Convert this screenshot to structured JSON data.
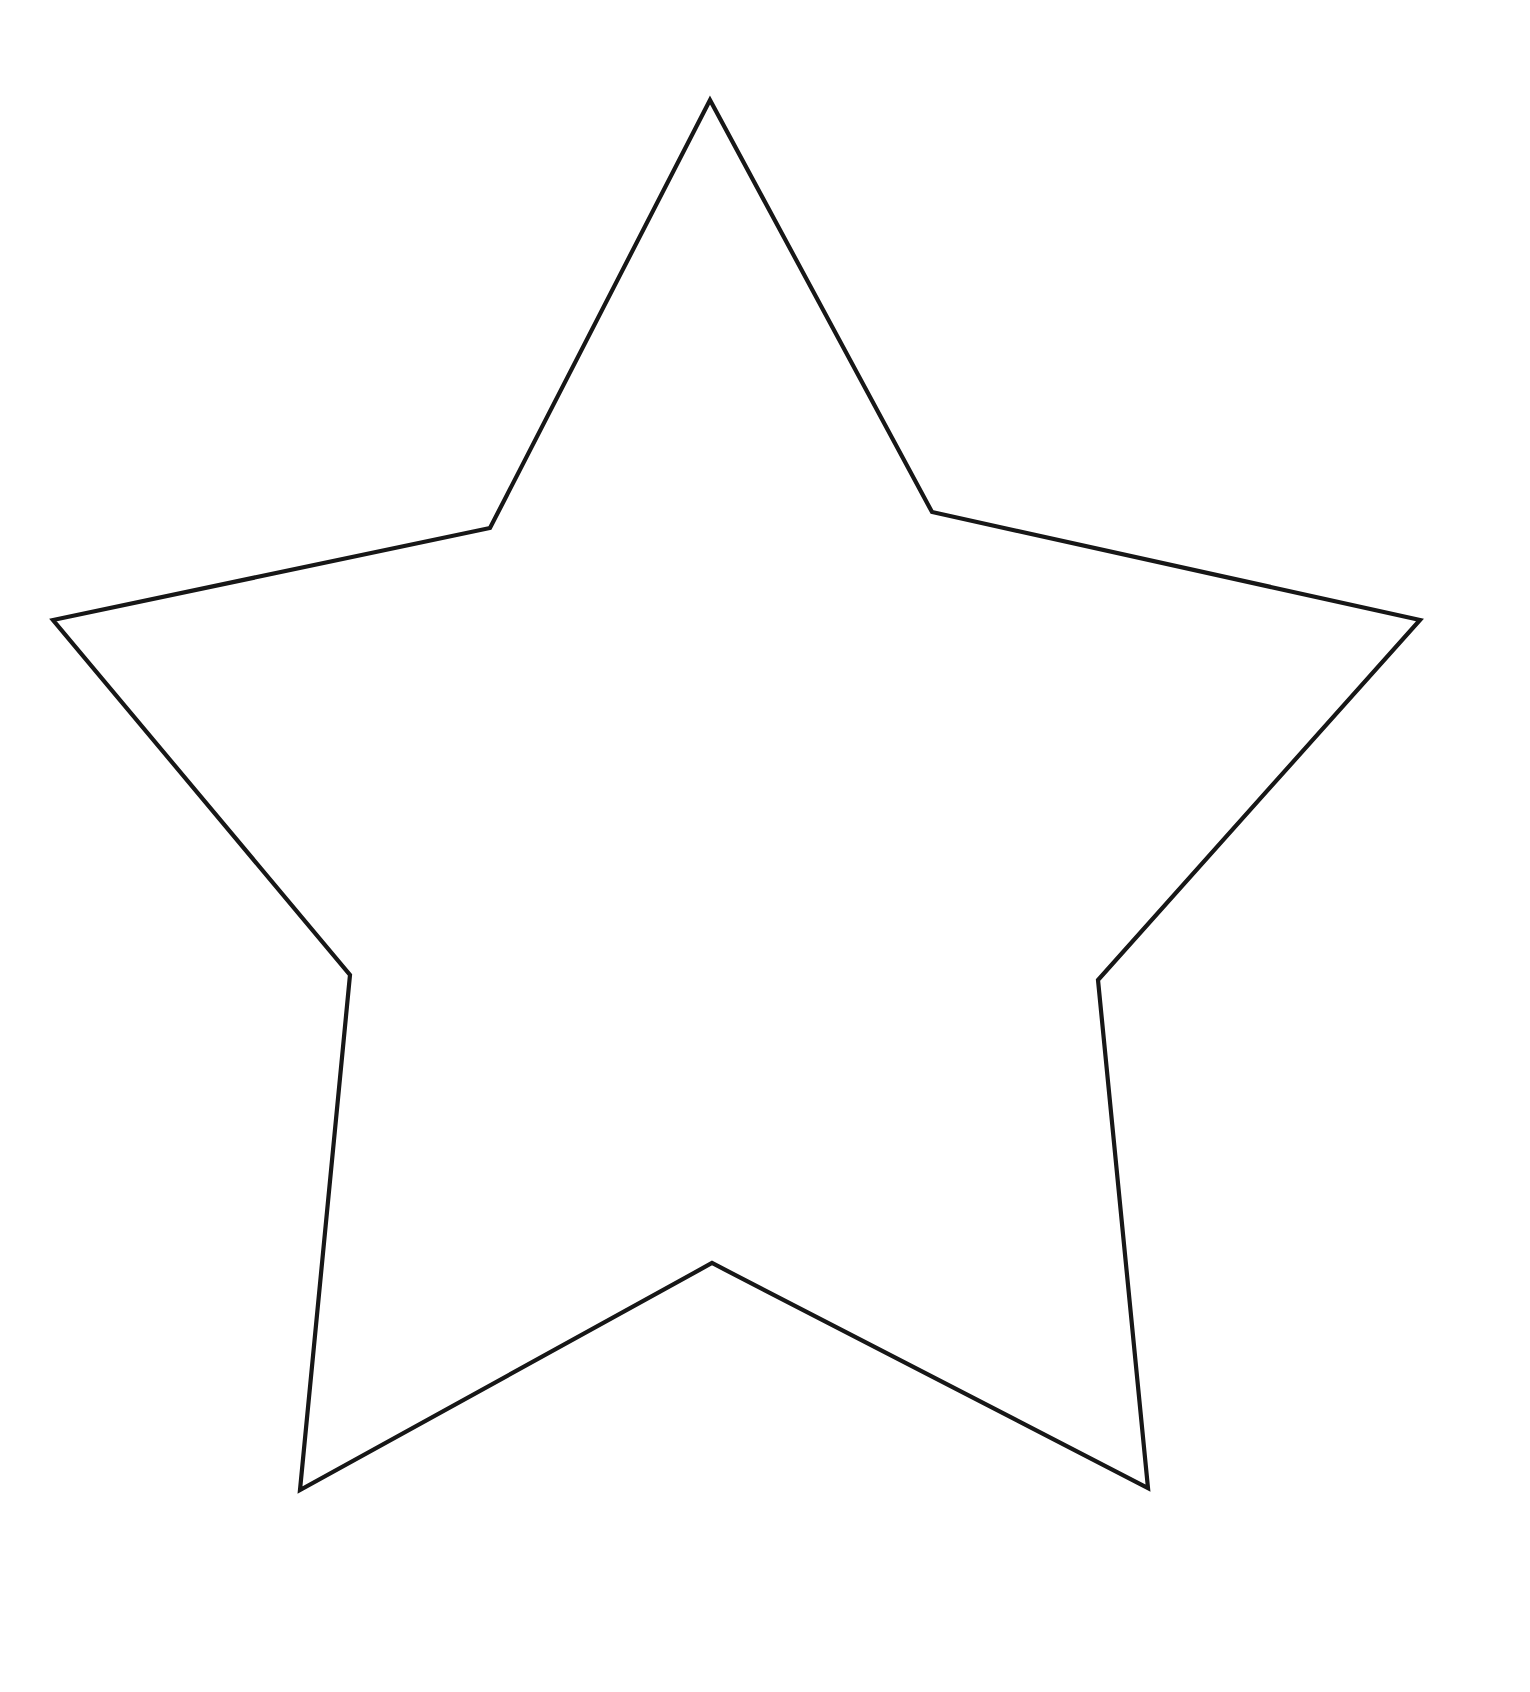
{
  "page": {
    "title": "Star Pattern",
    "background_color": "#ffffff",
    "width": 1530,
    "height": 1692,
    "kind": "printable-template"
  },
  "heading": {
    "text": "Star Pattern",
    "color": "#3a3a3c",
    "clipped_by_top_edge": true
  },
  "figure": {
    "name": "five-pointed-star-outline",
    "stroke_color": "#171717",
    "fill_color": "#ffffff",
    "stroke_width": 4.2,
    "points": 5,
    "path": "M 710,100 L 932,512 L 1420,620 L 1098,980 L 1148,1488 L 712,1263 L 300,1490 L 350,975 L 53,620 L 490,528 Z",
    "vertices": [
      {
        "name": "top-point",
        "type": "outer",
        "x": 710,
        "y": 100
      },
      {
        "name": "upper-right-notch",
        "type": "inner",
        "x": 932,
        "y": 512
      },
      {
        "name": "right-point",
        "type": "outer",
        "x": 1420,
        "y": 620
      },
      {
        "name": "lower-right-notch",
        "type": "inner",
        "x": 1098,
        "y": 980
      },
      {
        "name": "bottom-right-point",
        "type": "outer",
        "x": 1148,
        "y": 1488
      },
      {
        "name": "bottom-notch",
        "type": "inner",
        "x": 712,
        "y": 1263
      },
      {
        "name": "bottom-left-point",
        "type": "outer",
        "x": 300,
        "y": 1490
      },
      {
        "name": "lower-left-notch",
        "type": "inner",
        "x": 350,
        "y": 975
      },
      {
        "name": "left-point",
        "type": "outer",
        "x": 53,
        "y": 620
      },
      {
        "name": "upper-left-notch",
        "type": "inner",
        "x": 490,
        "y": 528
      }
    ]
  }
}
